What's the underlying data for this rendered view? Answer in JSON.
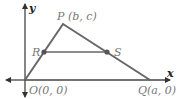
{
  "diagram": {
    "type": "coordinate-geometry-triangle",
    "colors": {
      "axis": "#333333",
      "triangle": "#666666",
      "label": "#777777",
      "point": "#555555"
    },
    "axes": {
      "x_label": "x",
      "y_label": "y"
    },
    "points": {
      "O": {
        "label": "O(0, 0)",
        "px": [
          25,
          80
        ]
      },
      "P": {
        "label": "P (b, c)",
        "px": [
          63,
          24
        ]
      },
      "Q": {
        "label": "Q(a, 0)",
        "px": [
          150,
          80
        ]
      },
      "R": {
        "label": "R",
        "px": [
          44,
          52
        ]
      },
      "S": {
        "label": "S",
        "px": [
          107,
          52
        ]
      }
    },
    "segments": [
      "OP",
      "PQ",
      "OQ",
      "RS"
    ]
  }
}
